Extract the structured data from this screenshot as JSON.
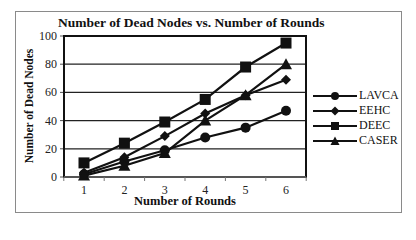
{
  "chart_data": {
    "type": "line",
    "title": "Number of  Dead Nodes vs. Number of Rounds",
    "xlabel": "Number of Rounds",
    "ylabel": "Number of Dead Nodes",
    "x": [
      1,
      2,
      3,
      4,
      5,
      6
    ],
    "ylim": [
      0,
      100
    ],
    "yticks": [
      0,
      20,
      40,
      60,
      80,
      100
    ],
    "grid": "horizontal",
    "legend_position": "right",
    "series": [
      {
        "name": "LAVCA",
        "marker": "circle",
        "values": [
          2,
          11,
          19,
          28,
          35,
          47
        ]
      },
      {
        "name": "EEHC",
        "marker": "diamond",
        "values": [
          3,
          14,
          29,
          45,
          58,
          69
        ]
      },
      {
        "name": "DEEC",
        "marker": "square",
        "values": [
          10,
          24,
          39,
          55,
          78,
          95
        ]
      },
      {
        "name": "CASER",
        "marker": "triangle",
        "values": [
          1,
          8,
          17,
          40,
          58,
          80
        ]
      }
    ]
  },
  "labels": {
    "title": "Number of  Dead Nodes vs. Number of Rounds",
    "xlabel": "Number of Rounds",
    "ylabel": "Number of Dead Nodes",
    "legend": [
      "LAVCA",
      "EEHC",
      "DEEC",
      "CASER"
    ]
  },
  "colors": {
    "line": "#111111",
    "grid": "#222222",
    "frame": "#8a8a8a"
  }
}
